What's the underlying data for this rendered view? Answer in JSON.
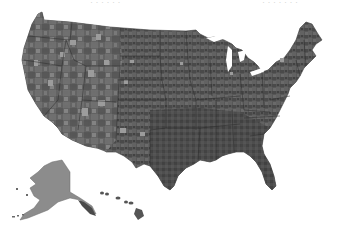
{
  "map": {
    "type": "choropleth",
    "region": "United States",
    "unit": "county",
    "color_scheme": "grayscale",
    "colors": {
      "background": "#ffffff",
      "lower48_base": "#5c5c5c",
      "dark_fill": "#3f3f3f",
      "mid_fill": "#6e6e6e",
      "light_fill": "#9a9a9a",
      "alaska_fill": "#8c8c8c",
      "hawaii_fill": "#555555",
      "state_border": "#2a2a2a"
    },
    "insets": [
      "Alaska",
      "Hawaii"
    ],
    "legend": null,
    "top_text_left": "· · · · · ·",
    "top_text_right": "· · · · · · ·"
  }
}
